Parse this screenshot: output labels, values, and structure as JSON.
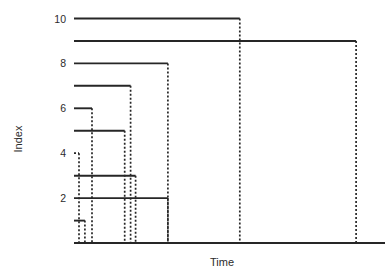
{
  "chart_data": {
    "type": "line",
    "title": "",
    "xlabel": "Time",
    "ylabel": "Index",
    "grid": false,
    "legend": null,
    "xlim": [
      0,
      1
    ],
    "ylim": [
      0,
      10.6
    ],
    "y_ticks": [
      2,
      4,
      6,
      8,
      10
    ],
    "y_tick_labels": [
      "2",
      "4",
      "6",
      "8",
      "10"
    ],
    "x_ticks": [],
    "x_tick_labels": [],
    "series": [
      {
        "name": "10",
        "index": 10,
        "x_start": 0.0,
        "x_end": 0.533,
        "style": "solid",
        "drop": "dashed"
      },
      {
        "name": "9",
        "index": 9,
        "x_start": 0.0,
        "x_end": 0.907,
        "style": "solid",
        "drop": "dashed"
      },
      {
        "name": "8",
        "index": 8,
        "x_start": 0.0,
        "x_end": 0.302,
        "style": "solid",
        "drop": "dashed"
      },
      {
        "name": "7",
        "index": 7,
        "x_start": 0.0,
        "x_end": 0.182,
        "style": "solid",
        "drop": "dashed"
      },
      {
        "name": "6",
        "index": 6,
        "x_start": 0.0,
        "x_end": 0.058,
        "style": "solid",
        "drop": "dashed"
      },
      {
        "name": "5",
        "index": 5,
        "x_start": 0.0,
        "x_end": 0.163,
        "style": "solid",
        "drop": "dashed"
      },
      {
        "name": "4",
        "index": 4,
        "x_start": 0.0,
        "x_end": 0.016,
        "style": "dashed",
        "drop": "dashed"
      },
      {
        "name": "3",
        "index": 3,
        "x_start": 0.0,
        "x_end": 0.198,
        "style": "solid",
        "drop": "dashed"
      },
      {
        "name": "2",
        "index": 2,
        "x_start": 0.0,
        "x_end": 0.302,
        "style": "solid",
        "drop": "dashed"
      },
      {
        "name": "1",
        "index": 1,
        "x_start": 0.0,
        "x_end": 0.035,
        "style": "solid",
        "drop": "dashed"
      }
    ],
    "drop_x_positions": [
      0.016,
      0.035,
      0.058,
      0.163,
      0.182,
      0.198,
      0.302,
      0.533,
      0.907
    ],
    "colors": {
      "line": "#262626",
      "axis": "#262626",
      "text": "#2b2b2b",
      "background": "#ffffff"
    }
  },
  "axes": {
    "x_title": "Time",
    "y_title": "Index"
  }
}
